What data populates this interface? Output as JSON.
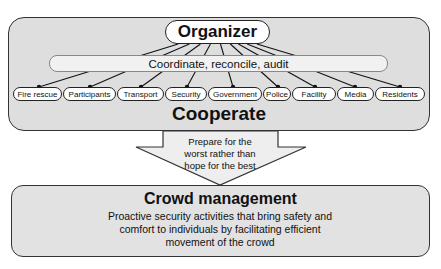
{
  "organizer": {
    "label": "Organizer"
  },
  "coordinate_bar": {
    "label": "Coordinate, reconcile, audit"
  },
  "stakeholders": [
    {
      "label": "Fire rescue",
      "x": 13,
      "w": 49,
      "dot": 39
    },
    {
      "label": "Participants",
      "x": 63,
      "w": 53,
      "dot": 90
    },
    {
      "label": "Transport",
      "x": 117,
      "w": 47,
      "dot": 141
    },
    {
      "label": "Security",
      "x": 165,
      "w": 42,
      "dot": 187
    },
    {
      "label": "Government",
      "x": 208,
      "w": 54,
      "dot": 233
    },
    {
      "label": "Police",
      "x": 263,
      "w": 28,
      "dot": 278
    },
    {
      "label": "Facility",
      "x": 292,
      "w": 44,
      "dot": 315
    },
    {
      "label": "Media",
      "x": 337,
      "w": 37,
      "dot": 355
    },
    {
      "label": "Residents",
      "x": 375,
      "w": 50,
      "dot": 400
    }
  ],
  "cooperate": {
    "label": "Cooperate"
  },
  "arrow": {
    "line1": "Prepare for the",
    "line2": "worst rather than",
    "line3": "hope for the best"
  },
  "crowd_management": {
    "title": "Crowd management",
    "line1": "Proactive security activities that bring safety and",
    "line2": "comfort to individuals by facilitating efficient",
    "line3": "movement of the crowd"
  }
}
